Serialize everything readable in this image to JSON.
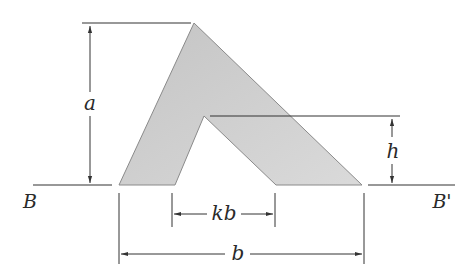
{
  "diagram": {
    "colors": {
      "fill": "#cfcfcf",
      "stroke": "#6e6e6e",
      "line": "#333333",
      "text": "#2a2a2a"
    },
    "labels": {
      "a": "a",
      "h": "h",
      "kb": "kb",
      "b": "b",
      "B": "B",
      "B_prime": "B'"
    },
    "dimensions": [
      {
        "name": "a",
        "description": "height of outer apex above base line BB'"
      },
      {
        "name": "h",
        "description": "height of inner apex above base line BB'"
      },
      {
        "name": "kb",
        "description": "width of inner opening at base"
      },
      {
        "name": "b",
        "description": "overall base width of the shape"
      }
    ]
  }
}
